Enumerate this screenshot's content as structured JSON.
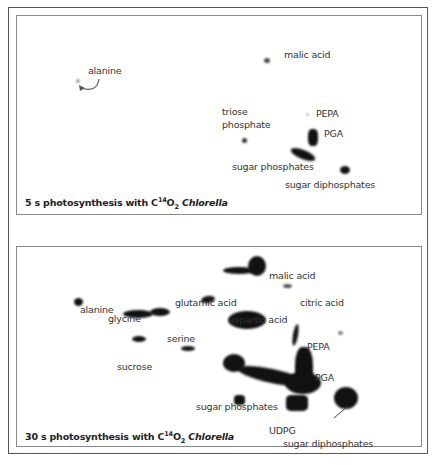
{
  "figure": {
    "top_panel": {
      "caption": {
        "time": "5 s photosynthesis with C",
        "superscript": "14",
        "oxygen": "O",
        "subscript": "2",
        "organism": "Chlorella"
      },
      "labels": {
        "alanine": "alanine",
        "malic_acid": "malic acid",
        "triose_phosphate_1": "triose",
        "triose_phosphate_2": "phosphate",
        "pepa": "PEPA",
        "pga": "PGA",
        "sugar_phosphates": "sugar phosphates",
        "sugar_diphosphates": "sugar diphosphates"
      }
    },
    "bottom_panel": {
      "caption": {
        "time": "30 s photosynthesis with C",
        "superscript": "14",
        "oxygen": "O",
        "subscript": "2",
        "organism": "Chlorella"
      },
      "labels": {
        "malic_acid": "malic acid",
        "citric_acid": "citric acid",
        "alanine": "alanine",
        "glutamic_acid": "glutamic acid",
        "glycine": "glycine",
        "aspartic_acid": "aspartic acid",
        "serine": "serine",
        "pepa": "PEPA",
        "sucrose": "sucrose",
        "pga": "PGA",
        "sugar_phosphates": "sugar phosphates",
        "udpg": "UDPG",
        "sugar_diphosphates": "sugar diphosphates"
      }
    },
    "colors": {
      "spot": "#111111",
      "frame": "#555555",
      "panel_border": "#8a8a8a",
      "text": "#333333"
    }
  }
}
